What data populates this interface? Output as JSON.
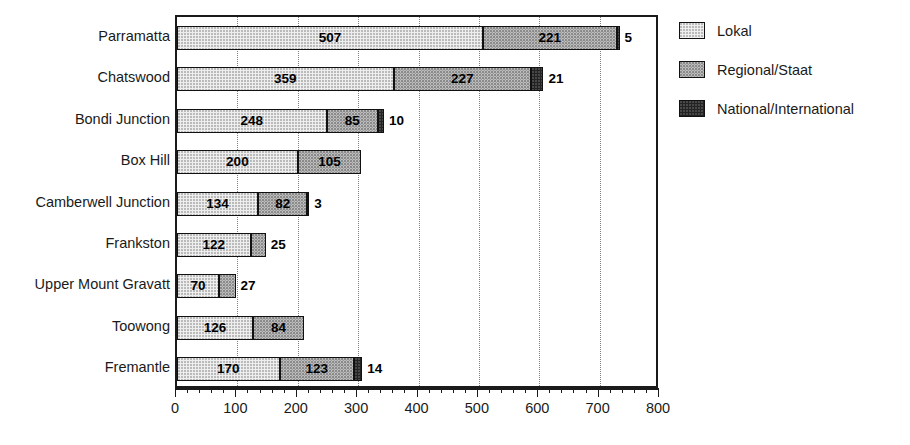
{
  "chart_data": {
    "type": "bar",
    "orientation": "horizontal",
    "stacked": true,
    "title": "",
    "xlabel": "",
    "ylabel": "",
    "xlim": [
      0,
      800
    ],
    "xticks": [
      0,
      100,
      200,
      300,
      400,
      500,
      600,
      700,
      800
    ],
    "xtick_labels": [
      "0",
      "100",
      "200",
      "300",
      "400",
      "500",
      "600",
      "700",
      "800"
    ],
    "minor_tick_step": 20,
    "grid": "vertical-dotted",
    "categories": [
      "Parramatta",
      "Chatswood",
      "Bondi Junction",
      "Box Hill",
      "Camberwell Junction",
      "Frankston",
      "Upper Mount Gravatt",
      "Toowong",
      "Fremantle"
    ],
    "series": [
      {
        "name": "Lokal",
        "color": "#eeeeee",
        "values": [
          507,
          359,
          248,
          200,
          134,
          122,
          70,
          126,
          170
        ]
      },
      {
        "name": "Regional/Staat",
        "color": "#c2c2c2",
        "values": [
          221,
          227,
          85,
          105,
          82,
          25,
          27,
          84,
          123
        ]
      },
      {
        "name": "National/International",
        "color": "#232323",
        "values": [
          5,
          21,
          10,
          0,
          3,
          0,
          0,
          0,
          14
        ]
      }
    ],
    "legend": {
      "position": "right",
      "entries": [
        {
          "label": "Lokal",
          "swatch": "light-halftone"
        },
        {
          "label": "Regional/Staat",
          "swatch": "medium-halftone"
        },
        {
          "label": "National/International",
          "swatch": "dark-halftone"
        }
      ]
    }
  }
}
